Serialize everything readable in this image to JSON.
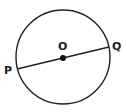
{
  "diagram": {
    "type": "circle-with-diameter",
    "circle": {
      "cx": 63,
      "cy": 57,
      "r": 47,
      "stroke": "#222222"
    },
    "center": {
      "label": "O",
      "x": 63,
      "y": 58
    },
    "points": [
      {
        "label": "P",
        "x": 17,
        "y": 69
      },
      {
        "label": "Q",
        "x": 109,
        "y": 47
      }
    ],
    "segment": {
      "from": "P",
      "to": "Q",
      "through": "O"
    }
  }
}
